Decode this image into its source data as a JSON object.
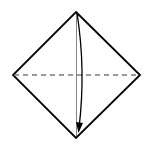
{
  "diagram": {
    "type": "origami-fold-step",
    "shape": "square-diamond",
    "vertices": {
      "top": [
        76,
        12
      ],
      "left": [
        13,
        75
      ],
      "right": [
        140,
        75
      ],
      "bottom": [
        76,
        138
      ]
    },
    "valley_fold_line": {
      "from": [
        13,
        75
      ],
      "to": [
        140,
        75
      ],
      "style": "dashed"
    },
    "fold_arrow": {
      "from": [
        77,
        13
      ],
      "to": [
        79,
        132
      ],
      "direction": "top-to-bottom",
      "curve": "bow-right"
    },
    "colors": {
      "stroke": "#000000",
      "dash": "#7a7a7a",
      "background": "#ffffff"
    }
  }
}
